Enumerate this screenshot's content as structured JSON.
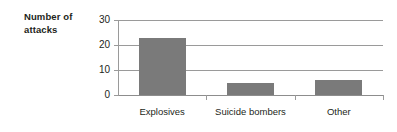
{
  "chart_data": {
    "type": "bar",
    "title": "",
    "categories": [
      "Explosives",
      "Suicide bombers",
      "Other"
    ],
    "values": [
      23,
      5,
      6
    ],
    "xlabel": "",
    "ylabel": "Number of attacks",
    "ylim": [
      0,
      30
    ],
    "yticks": [
      0,
      10,
      20,
      30
    ],
    "ytick_labels": [
      "0",
      "10",
      "20",
      "30"
    ],
    "grid": "horizontal",
    "legend": "none",
    "bar_color": "#7a7a7a",
    "gridline_color": "#9a9a9a",
    "text_color": "#231f20"
  },
  "axis_title": {
    "line1": "Number of",
    "line2": "attacks"
  }
}
